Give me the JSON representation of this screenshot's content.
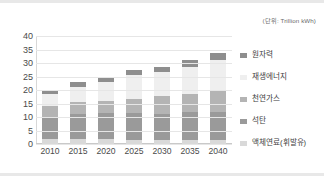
{
  "unit_note": "(단위: Trillion kWh)",
  "chart_data": {
    "type": "bar",
    "stacked": true,
    "title": "",
    "subtitle": "(단위: Trillion kWh)",
    "xlabel": "",
    "ylabel": "",
    "ylim": [
      0,
      40
    ],
    "ytick_step": 5,
    "grid": true,
    "legend_position": "right",
    "categories": [
      "2010",
      "2015",
      "2020",
      "2025",
      "2030",
      "2035",
      "2040"
    ],
    "yticks": [
      "40",
      "35",
      "30",
      "25",
      "20",
      "15",
      "10",
      "5",
      "0"
    ],
    "series": [
      {
        "name": "액체연료(휘발유)",
        "color": "#d9d9d9",
        "values": [
          2.0,
          1.8,
          1.7,
          1.6,
          1.5,
          1.5,
          1.4
        ]
      },
      {
        "name": "석탄",
        "color": "#9a9a9a",
        "values": [
          8.0,
          9.5,
          9.8,
          10.0,
          9.7,
          10.2,
          10.3
        ]
      },
      {
        "name": "천연가스",
        "color": "#b4b4b4",
        "values": [
          4.2,
          4.2,
          4.5,
          5.0,
          6.5,
          7.0,
          8.2
        ]
      },
      {
        "name": "재생에너지",
        "color": "#efefef",
        "values": [
          4.2,
          5.7,
          7.0,
          9.0,
          9.0,
          10.0,
          11.3
        ]
      },
      {
        "name": "원자력",
        "color": "#8e8e8e",
        "values": [
          1.7,
          1.8,
          2.0,
          2.0,
          2.0,
          2.3,
          2.6
        ]
      }
    ],
    "totals": [
      20.1,
      23.0,
      25.0,
      27.6,
      28.7,
      31.0,
      33.8
    ]
  },
  "legend": {
    "items": [
      {
        "label": "원자력",
        "color": "#8e8e8e"
      },
      {
        "label": "재생에너지",
        "color": "#efefef"
      },
      {
        "label": "천연가스",
        "color": "#b4b4b4"
      },
      {
        "label": "석탄",
        "color": "#9a9a9a"
      },
      {
        "label": "액체연료(휘발유)",
        "color": "#d9d9d9"
      }
    ]
  }
}
